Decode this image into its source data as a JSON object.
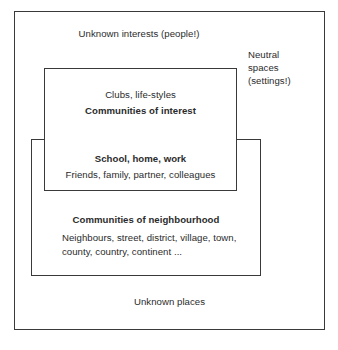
{
  "diagram": {
    "type": "nested-venn-boxes",
    "background_color": "#ffffff",
    "line_color": "#3a3a3a",
    "text_color": "#2b2b2b",
    "zones": {
      "outer": {
        "name": "outer-unknown-zone",
        "top_label": "Unknown interests (people!)",
        "right_label": "Neutral\nspaces\n(settings!)",
        "right_label_lines": [
          "Neutral",
          "spaces",
          "(settings!)"
        ],
        "bottom_label": "Unknown places"
      },
      "interest": {
        "name": "communities-of-interest",
        "subtitle": "Clubs, life-styles",
        "title": "Communities of interest"
      },
      "overlap": {
        "name": "school-home-work-overlap",
        "title": "School, home, work",
        "subtitle": "Friends, family, partner, colleagues"
      },
      "neighbourhood": {
        "name": "communities-of-neighbourhood",
        "title": "Communities of neighbourhood",
        "subtitle": "Neighbours, street, district, village, town, county, country, continent ..."
      }
    }
  }
}
